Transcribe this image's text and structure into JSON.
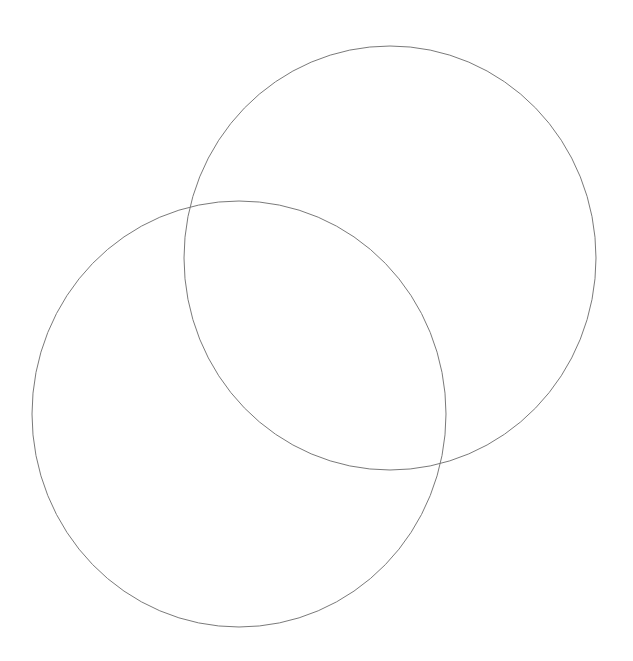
{
  "diagram": {
    "type": "venn",
    "background": "#ffffff",
    "stroke_color": "#7a7a7a",
    "stroke_width": 1,
    "circles": [
      {
        "id": "circle-upper-right",
        "cx": 390,
        "cy": 258,
        "rx": 206,
        "ry": 212,
        "fill": "none"
      },
      {
        "id": "circle-lower-left",
        "cx": 239,
        "cy": 414,
        "rx": 207,
        "ry": 213,
        "fill": "none"
      }
    ],
    "labels": []
  }
}
